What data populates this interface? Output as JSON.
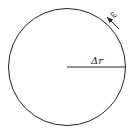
{
  "diagram": {
    "type": "circle-with-radius",
    "labels": {
      "radius": "Δr",
      "angular_velocity": "ω"
    },
    "colors": {
      "stroke": "#222222",
      "background": "#ffffff"
    }
  }
}
